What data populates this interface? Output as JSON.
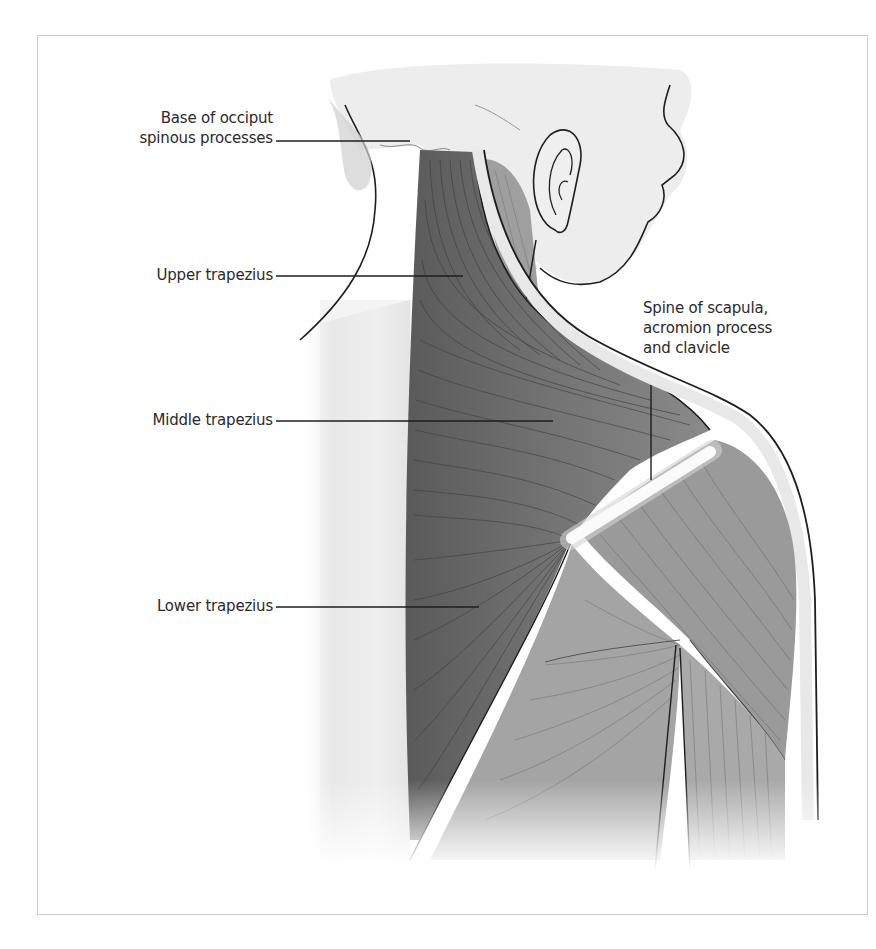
{
  "figure": {
    "colors": {
      "frame_border": "#cfcfcf",
      "background": "#ffffff",
      "muscle_dark": "#6e6e6e",
      "muscle_mid": "#8c8c8c",
      "muscle_light": "#a9a9a9",
      "skin": "#e9e9e9",
      "outline": "#1e1e1e",
      "label_text": "#2a2a2a",
      "bone_highlight": "#f5f5f5"
    },
    "labels": [
      {
        "id": "base-of-occiput",
        "lines": [
          "Base of occiput",
          "spinous processes"
        ],
        "leader": {
          "x1": 276,
          "y1": 141,
          "x2": 410,
          "y2": 141
        }
      },
      {
        "id": "upper-trapezius",
        "lines": [
          "Upper trapezius"
        ],
        "leader": {
          "x1": 276,
          "y1": 276,
          "x2": 463,
          "y2": 276
        }
      },
      {
        "id": "middle-trapezius",
        "lines": [
          "Middle trapezius"
        ],
        "leader": {
          "x1": 276,
          "y1": 421,
          "x2": 553,
          "y2": 421
        }
      },
      {
        "id": "lower-trapezius",
        "lines": [
          "Lower trapezius"
        ],
        "leader": {
          "x1": 276,
          "y1": 607,
          "x2": 479,
          "y2": 607
        }
      },
      {
        "id": "spine-of-scapula",
        "lines": [
          "Spine of scapula,",
          "acromion process",
          "and clavicle"
        ],
        "leader": {
          "x1": 651,
          "y1": 385,
          "x2": 651,
          "y2": 480
        }
      }
    ]
  }
}
